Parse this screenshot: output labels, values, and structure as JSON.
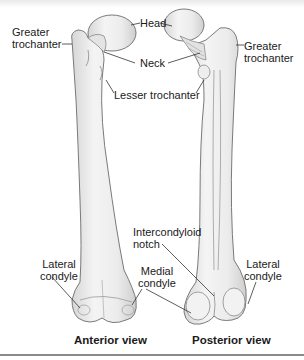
{
  "figure": {
    "views": [
      {
        "id": "anterior",
        "caption": "Anterior view"
      },
      {
        "id": "posterior",
        "caption": "Posterior view"
      }
    ],
    "labels": {
      "greater_trochanter_left": "Greater\ntrochanter",
      "greater_trochanter_left_l1": "Greater",
      "greater_trochanter_left_l2": "trochanter",
      "head": "Head",
      "neck": "Neck",
      "lesser_trochanter": "Lesser trochanter",
      "greater_trochanter_right_l1": "Greater",
      "greater_trochanter_right_l2": "trochanter",
      "intercondyloid_notch_l1": "Intercondyloid",
      "intercondyloid_notch_l2": "notch",
      "lateral_condyle_left_l1": "Lateral",
      "lateral_condyle_left_l2": "condyle",
      "medial_condyle_l1": "Medial",
      "medial_condyle_l2": "condyle",
      "lateral_condyle_right_l1": "Lateral",
      "lateral_condyle_right_l2": "condyle"
    },
    "colors": {
      "bone_fill": "#ededed",
      "bone_shade": "#d2d2d2",
      "bone_outline": "#7a7a7a",
      "leader_line": "#333333",
      "text": "#1a1a1a",
      "rule": "#8a8a8a"
    }
  }
}
